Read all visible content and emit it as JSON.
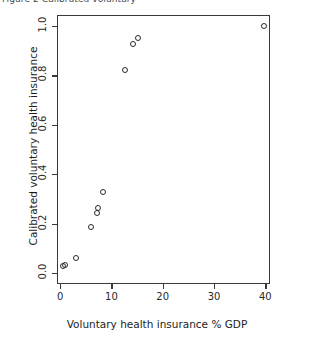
{
  "figure": {
    "top_fragment": "Figure 2  Calibrated voluntary",
    "xlabel": "Voluntary health insurance % GDP",
    "ylabel": "Calibrated voluntary health insurance"
  },
  "chart_data": {
    "type": "scatter",
    "title": "",
    "xlabel": "Voluntary health insurance % GDP",
    "ylabel": "Calibrated voluntary health insurance",
    "xlim": [
      -0.6,
      40.9
    ],
    "ylim": [
      -0.045,
      1.045
    ],
    "xticks": [
      0,
      10,
      20,
      30,
      40
    ],
    "xticklabels": [
      "0",
      "10",
      "20",
      "30",
      "40"
    ],
    "yticks": [
      0.0,
      0.2,
      0.4,
      0.6,
      0.8,
      1.0
    ],
    "yticklabels": [
      "0.0",
      "0.2",
      "0.4",
      "0.6",
      "0.8",
      "1.0"
    ],
    "grid": false,
    "legend": false,
    "marker": "open-circle",
    "marker_color": "#2b2b2b",
    "points": [
      {
        "x": 0.3,
        "y": 0.03
      },
      {
        "x": 0.8,
        "y": 0.035
      },
      {
        "x": 2.9,
        "y": 0.065
      },
      {
        "x": 5.9,
        "y": 0.19
      },
      {
        "x": 7.0,
        "y": 0.245
      },
      {
        "x": 7.2,
        "y": 0.265
      },
      {
        "x": 8.1,
        "y": 0.33
      },
      {
        "x": 12.4,
        "y": 0.825
      },
      {
        "x": 14.1,
        "y": 0.93
      },
      {
        "x": 14.9,
        "y": 0.955
      },
      {
        "x": 39.6,
        "y": 1.005
      }
    ]
  }
}
